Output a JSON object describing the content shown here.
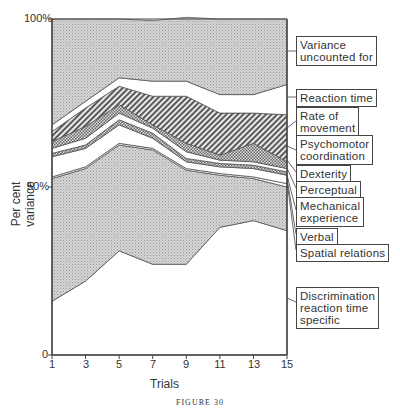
{
  "figure": {
    "caption": "FIGURE 30"
  },
  "axes": {
    "y_ticks": [
      "100%",
      "50%",
      "0"
    ],
    "x_ticks": [
      "1",
      "3",
      "5",
      "7",
      "9",
      "11",
      "13",
      "15"
    ],
    "xlabel": "Trials",
    "ylabel": "Per cent variance"
  },
  "legend": [
    {
      "label": "Variance\nuncounted for"
    },
    {
      "label": "Reaction time"
    },
    {
      "label": "Rate of\nmovement"
    },
    {
      "label": "Psychomotor\ncoordination"
    },
    {
      "label": "Dexterity"
    },
    {
      "label": "Perceptual"
    },
    {
      "label": "Mechanical\nexperience"
    },
    {
      "label": "Verbal"
    },
    {
      "label": "Spatial relations"
    },
    {
      "label": "Discrimination\nreaction time\nspecific"
    }
  ],
  "chart_data": {
    "type": "area",
    "stacked": true,
    "title": "",
    "xlabel": "Trials",
    "ylabel": "Per cent variance",
    "ylim": [
      0,
      100
    ],
    "y_ticks": [
      0,
      50,
      100
    ],
    "x": [
      1,
      3,
      5,
      7,
      9,
      11,
      13,
      15
    ],
    "series": [
      {
        "name": "Discrimination reaction time specific",
        "values": [
          16,
          22,
          31,
          27,
          27,
          38,
          40,
          37
        ]
      },
      {
        "name": "Spatial relations",
        "values": [
          36.5,
          33.5,
          31.5,
          34,
          28,
          15.5,
          12.5,
          13
        ]
      },
      {
        "name": "Verbal",
        "values": [
          0.5,
          0.5,
          0.5,
          0.5,
          0.5,
          0.5,
          0.5,
          1
        ]
      },
      {
        "name": "Mechanical experience",
        "values": [
          6,
          5.5,
          5.5,
          3,
          2,
          2,
          2.5,
          2.5
        ]
      },
      {
        "name": "Perceptual",
        "values": [
          1,
          1,
          1.5,
          1.5,
          1,
          1,
          1,
          1
        ]
      },
      {
        "name": "Dexterity",
        "values": [
          1.5,
          2,
          2,
          1.5,
          2,
          1,
          1,
          1
        ]
      },
      {
        "name": "Psychomotor coordination",
        "values": [
          2,
          3.5,
          2.5,
          1,
          2.5,
          1.5,
          5.5,
          2
        ]
      },
      {
        "name": "Rate of movement",
        "values": [
          3,
          5.5,
          5.5,
          8.5,
          14,
          12.5,
          9,
          14
        ]
      },
      {
        "name": "Reaction time",
        "values": [
          2,
          2,
          2.5,
          4.5,
          4.5,
          5.5,
          5.5,
          9
        ]
      },
      {
        "name": "Variance uncounted for",
        "values": [
          31.5,
          24.5,
          17.5,
          18,
          19,
          22.5,
          22.5,
          19.5
        ]
      }
    ],
    "grid": false,
    "legend_position": "right"
  }
}
